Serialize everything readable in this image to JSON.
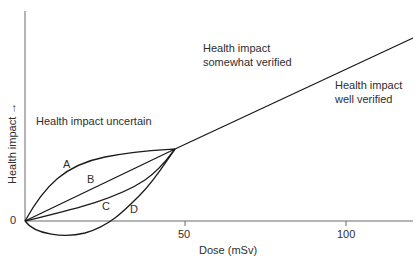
{
  "diagram": {
    "y_axis_label": "Health impact →",
    "x_axis_label": "Dose (mSv)",
    "origin_label": "0",
    "x_ticks": [
      {
        "label": "50",
        "value": 50
      },
      {
        "label": "100",
        "value": 100
      }
    ],
    "regions": {
      "uncertain": "Health impact uncertain",
      "somewhat_line1": "Health impact",
      "somewhat_line2": "somewhat verified",
      "well_line1": "Health impact",
      "well_line2": "well verified"
    },
    "curves": [
      {
        "id": "A",
        "label": "A",
        "description": "supra-linear (concave down)"
      },
      {
        "id": "B",
        "label": "B",
        "description": "linear"
      },
      {
        "id": "C",
        "label": "C",
        "description": "linear-quadratic (concave up)"
      },
      {
        "id": "D",
        "label": "D",
        "description": "hormesis (dips below zero)"
      }
    ],
    "convergence_dose_mSv": 47,
    "x_range": [
      0,
      120
    ],
    "line_color": "#1a1a1a",
    "axis_color": "#555555"
  }
}
